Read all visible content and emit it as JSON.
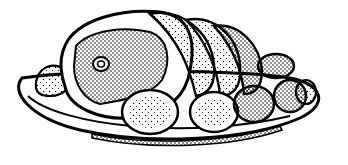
{
  "illustration": {
    "subject": "roast meat on a platter with potatoes",
    "style": "black-and-white stippled line art",
    "colors": {
      "ink": "#000000",
      "paper": "#ffffff"
    },
    "elements": [
      "platter",
      "roast",
      "roast-slices",
      "potatoes",
      "eye-of-meat"
    ]
  }
}
